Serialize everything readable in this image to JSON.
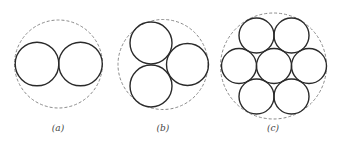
{
  "figure": {
    "colors": {
      "circle_stroke": "#2a2a2a",
      "enclosing_stroke": "#8a8a8a",
      "label": "#444444",
      "background": "#ffffff"
    },
    "panels": [
      {
        "label": "(a)",
        "count": 2,
        "enclosing": {
          "cx": 58.5,
          "cy": 64,
          "r": 44
        },
        "circles": [
          {
            "cx": 37,
            "cy": 64,
            "r": 21.8
          },
          {
            "cx": 80.5,
            "cy": 64,
            "r": 21.8
          }
        ],
        "label_pos": {
          "x": 58,
          "y": 131
        }
      },
      {
        "label": "(b)",
        "count": 3,
        "enclosing": {
          "cx": 163,
          "cy": 64.5,
          "r": 45
        },
        "circles": [
          {
            "cx": 151,
            "cy": 43,
            "r": 21
          },
          {
            "cx": 151,
            "cy": 86,
            "r": 21
          },
          {
            "cx": 187.5,
            "cy": 64.5,
            "r": 21
          }
        ],
        "label_pos": {
          "x": 163,
          "y": 131
        }
      },
      {
        "label": "(c)",
        "count": 7,
        "enclosing": {
          "cx": 273.5,
          "cy": 66,
          "r": 53
        },
        "circles": [
          {
            "cx": 274,
            "cy": 66,
            "r": 17.5
          },
          {
            "cx": 256.5,
            "cy": 35.5,
            "r": 17.5
          },
          {
            "cx": 291.5,
            "cy": 35.5,
            "r": 17.5
          },
          {
            "cx": 239,
            "cy": 66,
            "r": 17.5
          },
          {
            "cx": 309,
            "cy": 66,
            "r": 17.5
          },
          {
            "cx": 256.5,
            "cy": 96.5,
            "r": 17.5
          },
          {
            "cx": 291.5,
            "cy": 96.5,
            "r": 17.5
          }
        ],
        "label_pos": {
          "x": 273,
          "y": 131
        }
      }
    ]
  }
}
